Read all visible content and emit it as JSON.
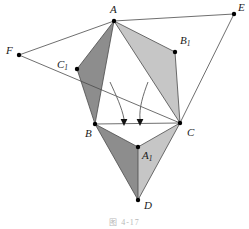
{
  "figure": {
    "caption": "图 4-17",
    "background_color": "#ffffff",
    "stroke_color": "#4a4a4a",
    "label_color": "#1a1a1a",
    "vertex_dot_color": "#000000",
    "shade_dark": "#8d8d8d",
    "shade_light": "#c6c6c6",
    "arrow_color": "#5a5a5a"
  },
  "points": [
    {
      "id": "A",
      "label": "A",
      "sub": "",
      "x": 114,
      "y": 21,
      "label_x": 110,
      "label_y": 4,
      "dot": true
    },
    {
      "id": "E",
      "label": "E",
      "sub": "",
      "x": 234,
      "y": 14,
      "label_x": 238,
      "label_y": 2,
      "dot": true
    },
    {
      "id": "F",
      "label": "F",
      "sub": "",
      "x": 19,
      "y": 55,
      "label_x": 6,
      "label_y": 45,
      "dot": true
    },
    {
      "id": "C1",
      "label": "C",
      "sub": "1",
      "x": 77,
      "y": 69,
      "label_x": 57,
      "label_y": 59,
      "dot": true
    },
    {
      "id": "B1",
      "label": "B",
      "sub": "1",
      "x": 175,
      "y": 52,
      "label_x": 180,
      "label_y": 35,
      "dot": true
    },
    {
      "id": "B",
      "label": "B",
      "sub": "",
      "x": 95,
      "y": 124,
      "label_x": 85,
      "label_y": 128,
      "dot": true
    },
    {
      "id": "C",
      "label": "C",
      "sub": "",
      "x": 180,
      "y": 123,
      "label_x": 187,
      "label_y": 127,
      "dot": true
    },
    {
      "id": "A1",
      "label": "A",
      "sub": "1",
      "x": 138,
      "y": 147,
      "label_x": 142,
      "label_y": 150,
      "dot": true
    },
    {
      "id": "D",
      "label": "D",
      "sub": "",
      "x": 138,
      "y": 200,
      "label_x": 144,
      "label_y": 200,
      "dot": true
    }
  ],
  "shaded_triangles": [
    {
      "name": "triangle-A-C1-B",
      "vertices": [
        "A",
        "C1",
        "B"
      ],
      "fill": "#8d8d8d"
    },
    {
      "name": "triangle-A-B1-C",
      "vertices": [
        "A",
        "B1",
        "C"
      ],
      "fill": "#c6c6c6"
    },
    {
      "name": "triangle-B-A1-D",
      "vertices": [
        "B",
        "A1",
        "D"
      ],
      "fill": "#8d8d8d"
    },
    {
      "name": "triangle-A1-C-D",
      "vertices": [
        "A1",
        "C",
        "D"
      ],
      "fill": "#c6c6c6"
    }
  ],
  "segments": [
    {
      "name": "segment-A-E",
      "from": "A",
      "to": "E"
    },
    {
      "name": "segment-A-F",
      "from": "A",
      "to": "F"
    },
    {
      "name": "segment-F-C",
      "from": "F",
      "to": "C"
    },
    {
      "name": "segment-E-C",
      "from": "E",
      "to": "C"
    },
    {
      "name": "segment-B-C",
      "from": "B",
      "to": "C"
    },
    {
      "name": "segment-A-B",
      "from": "A",
      "to": "B"
    },
    {
      "name": "segment-A-C",
      "from": "A",
      "to": "C"
    },
    {
      "name": "segment-A-C1",
      "from": "A",
      "to": "C1"
    },
    {
      "name": "segment-C1-B",
      "from": "C1",
      "to": "B"
    },
    {
      "name": "segment-A-B1",
      "from": "A",
      "to": "B1"
    },
    {
      "name": "segment-B1-C",
      "from": "B1",
      "to": "C"
    },
    {
      "name": "segment-B-A1",
      "from": "B",
      "to": "A1"
    },
    {
      "name": "segment-A1-C",
      "from": "A1",
      "to": "C"
    },
    {
      "name": "segment-A1-D",
      "from": "A1",
      "to": "D"
    },
    {
      "name": "segment-B-D",
      "from": "B",
      "to": "D"
    },
    {
      "name": "segment-C-D",
      "from": "C",
      "to": "D"
    }
  ],
  "arrows": [
    {
      "name": "rotation-arrow-left",
      "path": "M 110,82 C 116,95 122,108 124,119",
      "tip_x": 124,
      "tip_y": 126
    },
    {
      "name": "rotation-arrow-right",
      "path": "M 148,82 C 143,95 139,108 140,119",
      "tip_x": 140,
      "tip_y": 126
    }
  ]
}
